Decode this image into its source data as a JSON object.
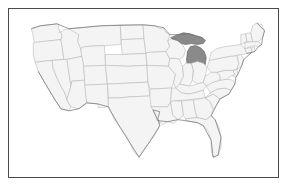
{
  "figure": {
    "type": "choropleth-map",
    "region": "United States",
    "title": "",
    "has_labels": false,
    "has_legend": false,
    "background_color": "#ffffff",
    "frame_color": "#4a4a4a"
  },
  "map": {
    "default_state_fill": "#f4f4f4",
    "default_state_stroke": "#b6b6b6",
    "highlight_fill": "#8a8a8a",
    "highlight_stroke": "#5d5d5d",
    "nation_outline_stroke": "#6e6e6e",
    "highlighted_states": [
      "Michigan"
    ],
    "states": [
      {
        "code": "WA",
        "name": "Washington",
        "highlighted": false
      },
      {
        "code": "OR",
        "name": "Oregon",
        "highlighted": false
      },
      {
        "code": "CA",
        "name": "California",
        "highlighted": false
      },
      {
        "code": "NV",
        "name": "Nevada",
        "highlighted": false
      },
      {
        "code": "ID",
        "name": "Idaho",
        "highlighted": false
      },
      {
        "code": "MT",
        "name": "Montana",
        "highlighted": false
      },
      {
        "code": "WY",
        "name": "Wyoming",
        "highlighted": false
      },
      {
        "code": "UT",
        "name": "Utah",
        "highlighted": false
      },
      {
        "code": "AZ",
        "name": "Arizona",
        "highlighted": false
      },
      {
        "code": "CO",
        "name": "Colorado",
        "highlighted": false
      },
      {
        "code": "NM",
        "name": "New Mexico",
        "highlighted": false
      },
      {
        "code": "ND",
        "name": "North Dakota",
        "highlighted": false
      },
      {
        "code": "SD",
        "name": "South Dakota",
        "highlighted": false
      },
      {
        "code": "NE",
        "name": "Nebraska",
        "highlighted": false
      },
      {
        "code": "KS",
        "name": "Kansas",
        "highlighted": false
      },
      {
        "code": "OK",
        "name": "Oklahoma",
        "highlighted": false
      },
      {
        "code": "TX",
        "name": "Texas",
        "highlighted": false
      },
      {
        "code": "MN",
        "name": "Minnesota",
        "highlighted": false
      },
      {
        "code": "IA",
        "name": "Iowa",
        "highlighted": false
      },
      {
        "code": "MO",
        "name": "Missouri",
        "highlighted": false
      },
      {
        "code": "AR",
        "name": "Arkansas",
        "highlighted": false
      },
      {
        "code": "LA",
        "name": "Louisiana",
        "highlighted": false
      },
      {
        "code": "WI",
        "name": "Wisconsin",
        "highlighted": false
      },
      {
        "code": "IL",
        "name": "Illinois",
        "highlighted": false
      },
      {
        "code": "MI",
        "name": "Michigan",
        "highlighted": true
      },
      {
        "code": "IN",
        "name": "Indiana",
        "highlighted": false
      },
      {
        "code": "OH",
        "name": "Ohio",
        "highlighted": false
      },
      {
        "code": "KY",
        "name": "Kentucky",
        "highlighted": false
      },
      {
        "code": "TN",
        "name": "Tennessee",
        "highlighted": false
      },
      {
        "code": "MS",
        "name": "Mississippi",
        "highlighted": false
      },
      {
        "code": "AL",
        "name": "Alabama",
        "highlighted": false
      },
      {
        "code": "GA",
        "name": "Georgia",
        "highlighted": false
      },
      {
        "code": "FL",
        "name": "Florida",
        "highlighted": false
      },
      {
        "code": "SC",
        "name": "South Carolina",
        "highlighted": false
      },
      {
        "code": "NC",
        "name": "North Carolina",
        "highlighted": false
      },
      {
        "code": "VA",
        "name": "Virginia",
        "highlighted": false
      },
      {
        "code": "WV",
        "name": "West Virginia",
        "highlighted": false
      },
      {
        "code": "MD",
        "name": "Maryland",
        "highlighted": false
      },
      {
        "code": "DE",
        "name": "Delaware",
        "highlighted": false
      },
      {
        "code": "PA",
        "name": "Pennsylvania",
        "highlighted": false
      },
      {
        "code": "NJ",
        "name": "New Jersey",
        "highlighted": false
      },
      {
        "code": "NY",
        "name": "New York",
        "highlighted": false
      },
      {
        "code": "CT",
        "name": "Connecticut",
        "highlighted": false
      },
      {
        "code": "RI",
        "name": "Rhode Island",
        "highlighted": false
      },
      {
        "code": "MA",
        "name": "Massachusetts",
        "highlighted": false
      },
      {
        "code": "VT",
        "name": "Vermont",
        "highlighted": false
      },
      {
        "code": "NH",
        "name": "New Hampshire",
        "highlighted": false
      },
      {
        "code": "ME",
        "name": "Maine",
        "highlighted": false
      }
    ]
  }
}
